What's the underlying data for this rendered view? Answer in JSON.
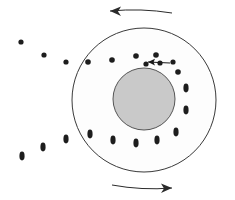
{
  "figure": {
    "canvas": {
      "width": 235,
      "height": 200,
      "background": "#ffffff"
    },
    "outer_disk": {
      "name": "outer-disk-circle",
      "cx": 144,
      "cy": 100,
      "r": 72,
      "fill": "#fdfdfd",
      "stroke": "#3a3a3a",
      "stroke_width": 1
    },
    "inner_core": {
      "name": "inner-core-circle",
      "cx": 144,
      "cy": 99,
      "r": 31,
      "fill": "#c9c9c9",
      "stroke": "#555555",
      "stroke_width": 1
    },
    "rotation_arrows": [
      {
        "id": "top-rotation-arrow",
        "label": "counterclockwise top arc",
        "direction": "left",
        "path": "M 172 13 L 110 11",
        "arrowhead_at": "start-end-left",
        "color": "#2b2b2b"
      },
      {
        "id": "bottom-rotation-arrow",
        "label": "counterclockwise bottom arc",
        "direction": "right",
        "path": "M 112 185 L 172 188",
        "arrowhead_at": "end-right",
        "color": "#2b2b2b"
      }
    ],
    "inner_velocity_arrow": {
      "id": "inner-velocity-arrow",
      "label": "particle velocity vector",
      "direction": "left",
      "x1": 170,
      "y1": 63,
      "x2": 148,
      "y2": 62,
      "color": "#1a1a1a"
    },
    "dot_color": "#1d1d1d",
    "dots_single": [
      {
        "id": "field-dot-1",
        "cx": 21,
        "cy": 42,
        "r": 2.6
      },
      {
        "id": "field-dot-2",
        "cx": 44,
        "cy": 55,
        "r": 2.6
      },
      {
        "id": "field-dot-3",
        "cx": 66,
        "cy": 62,
        "r": 2.6
      },
      {
        "id": "ring-dot-top-1",
        "cx": 88,
        "cy": 62,
        "r": 2.8
      },
      {
        "id": "ring-dot-top-2",
        "cx": 112,
        "cy": 60,
        "r": 2.8
      },
      {
        "id": "ring-dot-top-3",
        "cx": 136,
        "cy": 56,
        "r": 2.8
      },
      {
        "id": "ring-dot-top-4",
        "cx": 156,
        "cy": 55,
        "r": 2.8
      },
      {
        "id": "ring-dot-arrow-tail",
        "cx": 146,
        "cy": 64,
        "r": 2.6
      },
      {
        "id": "ring-dot-arrow-mid",
        "cx": 160,
        "cy": 63,
        "r": 2.6
      },
      {
        "id": "ring-dot-arrow-head",
        "cx": 173,
        "cy": 62,
        "r": 2.6
      },
      {
        "id": "ring-dot-right-upper",
        "cx": 178,
        "cy": 72,
        "r": 2.8
      }
    ],
    "dots_paired": [
      {
        "id": "field-pair-1",
        "cx": 22,
        "cy": 156,
        "rx": 2.6,
        "ry": 4.4
      },
      {
        "id": "field-pair-2",
        "cx": 43,
        "cy": 147,
        "rx": 2.6,
        "ry": 4.4
      },
      {
        "id": "field-pair-3",
        "cx": 66,
        "cy": 139,
        "rx": 2.6,
        "ry": 4.4
      },
      {
        "id": "ring-pair-left-lower",
        "cx": 90,
        "cy": 134,
        "rx": 2.6,
        "ry": 4.4
      },
      {
        "id": "ring-pair-bottom-1",
        "cx": 113,
        "cy": 140,
        "rx": 2.6,
        "ry": 4.4
      },
      {
        "id": "ring-pair-bottom-2",
        "cx": 136,
        "cy": 143,
        "rx": 2.6,
        "ry": 4.4
      },
      {
        "id": "ring-pair-bottom-3",
        "cx": 157,
        "cy": 140,
        "rx": 2.6,
        "ry": 4.4
      },
      {
        "id": "ring-pair-bottom-4",
        "cx": 176,
        "cy": 132,
        "rx": 2.6,
        "ry": 4.4
      },
      {
        "id": "ring-pair-right-1",
        "cx": 186,
        "cy": 88,
        "rx": 2.6,
        "ry": 4.4
      },
      {
        "id": "ring-pair-right-2",
        "cx": 186,
        "cy": 110,
        "rx": 2.6,
        "ry": 4.4
      }
    ]
  }
}
